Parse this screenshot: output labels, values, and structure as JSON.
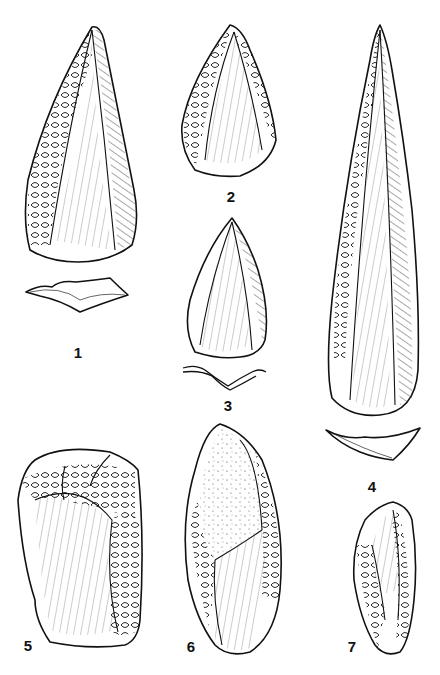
{
  "figure": {
    "type": "archaeological line drawing of stone tools",
    "background": "#ffffff",
    "ink": "#111111",
    "artifacts": [
      {
        "label": "1",
        "x": 78,
        "y": 352,
        "desc": "elongated triangular point with retouched edges, cross-section below"
      },
      {
        "label": "2",
        "x": 231,
        "y": 196,
        "desc": "small triangular point with retouched edges"
      },
      {
        "label": "3",
        "x": 228,
        "y": 405,
        "desc": "triangular point, cross-section below"
      },
      {
        "label": "4",
        "x": 372,
        "y": 486,
        "desc": "long narrow blade point, cross-section below"
      },
      {
        "label": "5",
        "x": 28,
        "y": 645,
        "desc": "rectangular flake core with removal scars"
      },
      {
        "label": "6",
        "x": 191,
        "y": 646,
        "desc": "oval tool with cortex surface (stippled)"
      },
      {
        "label": "7",
        "x": 352,
        "y": 646,
        "desc": "small oval retouched scraper"
      }
    ]
  }
}
